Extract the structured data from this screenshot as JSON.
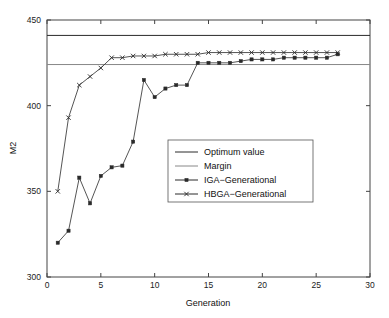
{
  "chart_data": {
    "type": "line",
    "title": "",
    "xlabel": "Generation",
    "ylabel": "M2",
    "xlim": [
      0,
      30
    ],
    "ylim": [
      300,
      450
    ],
    "xticks": [
      0,
      5,
      10,
      15,
      20,
      25,
      30
    ],
    "yticks": [
      300,
      350,
      400,
      450
    ],
    "grid": false,
    "legend_position": "center",
    "x": [
      1,
      2,
      3,
      4,
      5,
      6,
      7,
      8,
      9,
      10,
      11,
      12,
      13,
      14,
      15,
      16,
      17,
      18,
      19,
      20,
      21,
      22,
      23,
      24,
      25,
      26,
      27
    ],
    "series": [
      {
        "name": "Optimum value",
        "type": "hline",
        "value": 441,
        "color": "#2a2a2a",
        "marker": "none"
      },
      {
        "name": "Margin",
        "type": "hline",
        "value": 424,
        "color": "#888888",
        "marker": "none"
      },
      {
        "name": "IGA−Generational",
        "type": "line",
        "color": "#2a2a2a",
        "marker": "square",
        "values": [
          320,
          327,
          358,
          343,
          359,
          364,
          365,
          379,
          415,
          405,
          410,
          412,
          412,
          425,
          425,
          425,
          425,
          426,
          427,
          427,
          427,
          428,
          428,
          428,
          428,
          428,
          430
        ]
      },
      {
        "name": "HBGA−Generational",
        "type": "line",
        "color": "#2a2a2a",
        "marker": "cross",
        "values": [
          350,
          393,
          412,
          417,
          422,
          428,
          428,
          429,
          429,
          429,
          430,
          430,
          430,
          430,
          431,
          431,
          431,
          431,
          431,
          431,
          431,
          431,
          431,
          431,
          431,
          431,
          431
        ]
      }
    ],
    "legend_entries": [
      {
        "label": "Optimum value",
        "marker": "none",
        "color": "#2a2a2a"
      },
      {
        "label": "Margin",
        "marker": "none",
        "color": "#888888"
      },
      {
        "label": "IGA−Generational",
        "marker": "square",
        "color": "#2a2a2a"
      },
      {
        "label": "HBGA−Generational",
        "marker": "cross",
        "color": "#2a2a2a"
      }
    ]
  },
  "axis": {
    "xlabel": "Generation",
    "ylabel": "M2",
    "xtick_labels": [
      "0",
      "5",
      "10",
      "15",
      "20",
      "25",
      "30"
    ],
    "ytick_labels": [
      "300",
      "350",
      "400",
      "450"
    ]
  }
}
